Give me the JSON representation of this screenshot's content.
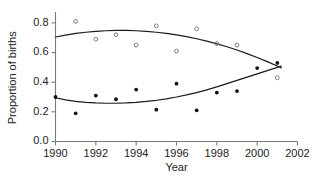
{
  "chart_data": {
    "type": "scatter",
    "title": "",
    "xlabel": "Year",
    "ylabel": "Proportion of births",
    "xlim": [
      1990,
      2002
    ],
    "ylim": [
      0.0,
      0.86
    ],
    "grid": false,
    "legend": "none",
    "xticks": [
      1990,
      1992,
      1994,
      1996,
      1998,
      2000,
      2002
    ],
    "xtick_labels": [
      "1990",
      "1992",
      "1994",
      "1996",
      "1998",
      "2000",
      "2002"
    ],
    "yticks": [
      0.0,
      0.2,
      0.4,
      0.6,
      0.8
    ],
    "ytick_labels": [
      "0.0",
      "0.2",
      "0.4",
      "0.6",
      "0.8"
    ],
    "series": [
      {
        "name": "upper-proportion",
        "marker": "open-circle",
        "marker_color": "#7d7d7d",
        "x": [
          1991,
          1992,
          1993,
          1994,
          1995,
          1996,
          1997,
          1998,
          1999,
          2001
        ],
        "values": [
          0.81,
          0.69,
          0.72,
          0.65,
          0.78,
          0.61,
          0.76,
          0.66,
          0.65,
          0.43
        ]
      },
      {
        "name": "lower-proportion",
        "marker": "filled-circle",
        "marker_color": "#111111",
        "x": [
          1990,
          1991,
          1992,
          1993,
          1994,
          1995,
          1996,
          1997,
          1998,
          1999,
          2000,
          2001
        ],
        "values": [
          0.3,
          0.19,
          0.31,
          0.285,
          0.35,
          0.215,
          0.39,
          0.21,
          0.33,
          0.34,
          0.495,
          0.53
        ]
      }
    ],
    "fit_curves": [
      {
        "name": "upper-fit",
        "color": "#1a1a1a",
        "x": [
          1990,
          1990.5,
          1991,
          1991.5,
          1992,
          1992.5,
          1993,
          1993.5,
          1994,
          1994.5,
          1995,
          1995.5,
          1996,
          1996.5,
          1997,
          1997.5,
          1998,
          1998.5,
          1999,
          1999.5,
          2000,
          2000.5,
          2001,
          2001.2
        ],
        "values": [
          0.705,
          0.718,
          0.729,
          0.737,
          0.743,
          0.747,
          0.749,
          0.749,
          0.747,
          0.743,
          0.737,
          0.729,
          0.719,
          0.707,
          0.693,
          0.677,
          0.659,
          0.639,
          0.617,
          0.593,
          0.567,
          0.539,
          0.509,
          0.496
        ]
      },
      {
        "name": "lower-fit",
        "color": "#1a1a1a",
        "x": [
          1990,
          1990.5,
          1991,
          1991.5,
          1992,
          1992.5,
          1993,
          1993.5,
          1994,
          1994.5,
          1995,
          1995.5,
          1996,
          1996.5,
          1997,
          1997.5,
          1998,
          1998.5,
          1999,
          1999.5,
          2000,
          2000.5,
          2001,
          2001.2
        ],
        "values": [
          0.295,
          0.281,
          0.271,
          0.264,
          0.26,
          0.258,
          0.258,
          0.26,
          0.264,
          0.27,
          0.278,
          0.288,
          0.3,
          0.314,
          0.33,
          0.348,
          0.368,
          0.39,
          0.412,
          0.434,
          0.456,
          0.478,
          0.5,
          0.509
        ]
      }
    ]
  }
}
